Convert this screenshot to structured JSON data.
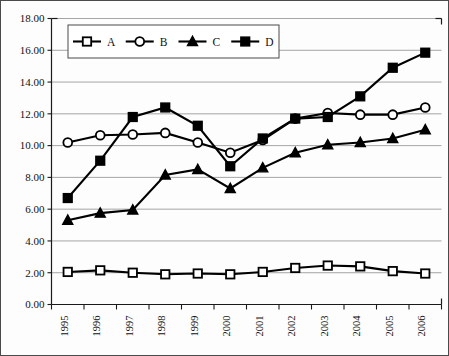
{
  "chart_data": {
    "type": "line",
    "title": "",
    "subtitle": "",
    "xlabel": "",
    "ylabel": "",
    "categories": [
      "1995",
      "1996",
      "1997",
      "1998",
      "1999",
      "2000",
      "2001",
      "2002",
      "2003",
      "2004",
      "2005",
      "2006"
    ],
    "ylim": [
      0.0,
      18.0
    ],
    "ytick_step": 2.0,
    "ytick_labels": [
      "0.00",
      "2.00",
      "4.00",
      "6.00",
      "8.00",
      "10.00",
      "12.00",
      "14.00",
      "16.00",
      "18.00"
    ],
    "grid": true,
    "legend_position": "top-center-inside",
    "series": [
      {
        "name": "A",
        "marker": "open-square",
        "values": [
          2.05,
          2.15,
          2.0,
          1.9,
          1.95,
          1.9,
          2.05,
          2.3,
          2.45,
          2.4,
          2.1,
          1.95
        ]
      },
      {
        "name": "B",
        "marker": "open-circle",
        "values": [
          10.2,
          10.65,
          10.7,
          10.8,
          10.2,
          9.55,
          10.35,
          11.7,
          12.05,
          11.95,
          11.95,
          12.4
        ]
      },
      {
        "name": "C",
        "marker": "filled-triangle",
        "values": [
          5.3,
          5.75,
          5.95,
          8.15,
          8.5,
          7.3,
          8.6,
          9.55,
          10.05,
          10.2,
          10.45,
          11.0
        ]
      },
      {
        "name": "D",
        "marker": "filled-square",
        "values": [
          6.7,
          9.05,
          11.8,
          12.4,
          11.25,
          8.7,
          10.45,
          11.7,
          11.8,
          13.1,
          14.9,
          15.85
        ]
      }
    ]
  },
  "legend": {
    "entries": [
      {
        "label": "A",
        "marker": "open-square"
      },
      {
        "label": "B",
        "marker": "open-circle"
      },
      {
        "label": "C",
        "marker": "filled-triangle"
      },
      {
        "label": "D",
        "marker": "filled-square"
      }
    ]
  }
}
